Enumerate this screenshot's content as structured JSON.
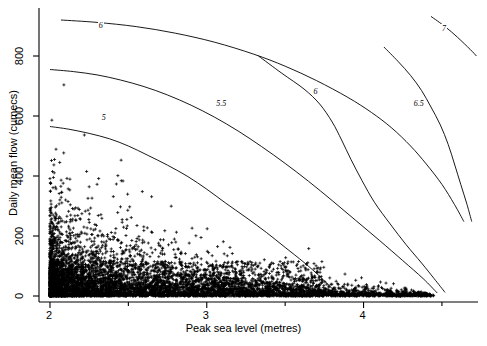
{
  "chart_data": {
    "type": "scatter",
    "title": "",
    "xlabel": "Peak sea level (metres)",
    "ylabel": "Daily mean flow (cumecs)",
    "xlim": [
      1.93,
      4.73
    ],
    "ylim": [
      -20,
      960
    ],
    "xticks": [
      2,
      3,
      4
    ],
    "xtick_labels": [
      "2",
      "3",
      "4"
    ],
    "xminorticks": [
      2.5,
      3.5,
      4.5
    ],
    "yticks": [
      0,
      200,
      400,
      600,
      800
    ],
    "ytick_labels": [
      "0",
      "200",
      "400",
      "600",
      "800"
    ],
    "grid": false,
    "legend": null,
    "marker": "plus",
    "marker_color": "#000000",
    "line_color": "#000000",
    "contours": [
      {
        "label": "5",
        "label_x": 2.35,
        "label_y": 592,
        "points": [
          [
            2.0,
            565
          ],
          [
            2.12,
            556
          ],
          [
            2.25,
            542
          ],
          [
            2.38,
            524
          ],
          [
            2.5,
            500
          ],
          [
            2.62,
            470
          ],
          [
            2.75,
            436
          ],
          [
            2.88,
            398
          ],
          [
            3.0,
            356
          ],
          [
            3.12,
            310
          ],
          [
            3.25,
            262
          ],
          [
            3.38,
            212
          ],
          [
            3.5,
            162
          ],
          [
            3.62,
            112
          ],
          [
            3.72,
            66
          ],
          [
            3.8,
            25
          ],
          [
            3.86,
            0
          ]
        ]
      },
      {
        "label": "5.5",
        "label_x": 3.08,
        "label_y": 640,
        "points": [
          [
            2.0,
            755
          ],
          [
            2.15,
            748
          ],
          [
            2.3,
            737
          ],
          [
            2.45,
            720
          ],
          [
            2.6,
            698
          ],
          [
            2.75,
            670
          ],
          [
            2.9,
            636
          ],
          [
            3.05,
            596
          ],
          [
            3.2,
            550
          ],
          [
            3.35,
            498
          ],
          [
            3.5,
            442
          ],
          [
            3.65,
            382
          ],
          [
            3.8,
            318
          ],
          [
            3.95,
            252
          ],
          [
            4.1,
            186
          ],
          [
            4.25,
            118
          ],
          [
            4.38,
            58
          ],
          [
            4.47,
            10
          ]
        ]
      },
      {
        "label": "6",
        "label_x": 2.33,
        "label_y": 900,
        "points": [
          [
            2.07,
            920
          ],
          [
            2.3,
            912
          ],
          [
            2.55,
            898
          ],
          [
            2.8,
            876
          ],
          [
            3.05,
            846
          ],
          [
            3.3,
            806
          ],
          [
            3.5,
            766
          ],
          [
            3.7,
            718
          ],
          [
            3.9,
            662
          ],
          [
            4.05,
            612
          ],
          [
            4.18,
            560
          ],
          [
            4.3,
            500
          ],
          [
            4.4,
            440
          ],
          [
            4.5,
            372
          ],
          [
            4.58,
            305
          ],
          [
            4.64,
            248
          ]
        ]
      },
      {
        "label": "6",
        "label_x": 3.7,
        "label_y": 680,
        "points": [
          [
            3.33,
            800
          ],
          [
            3.48,
            742
          ],
          [
            3.62,
            690
          ],
          [
            3.72,
            640
          ],
          [
            3.8,
            580
          ],
          [
            3.86,
            520
          ],
          [
            3.92,
            455
          ],
          [
            3.99,
            385
          ],
          [
            4.07,
            312
          ],
          [
            4.17,
            240
          ],
          [
            4.27,
            172
          ],
          [
            4.37,
            110
          ],
          [
            4.45,
            58
          ],
          [
            4.52,
            12
          ]
        ]
      },
      {
        "label": "6.5",
        "label_x": 4.34,
        "label_y": 640,
        "points": [
          [
            4.13,
            830
          ],
          [
            4.22,
            782
          ],
          [
            4.3,
            735
          ],
          [
            4.37,
            685
          ],
          [
            4.43,
            630
          ],
          [
            4.49,
            570
          ],
          [
            4.54,
            505
          ],
          [
            4.58,
            440
          ],
          [
            4.62,
            372
          ],
          [
            4.66,
            305
          ],
          [
            4.69,
            248
          ]
        ]
      },
      {
        "label": "7",
        "label_x": 4.52,
        "label_y": 890,
        "points": [
          [
            4.43,
            932
          ],
          [
            4.52,
            898
          ],
          [
            4.6,
            862
          ],
          [
            4.68,
            822
          ],
          [
            4.72,
            800
          ]
        ]
      }
    ],
    "scatter_summary": {
      "n_points_approx": 4800,
      "x_mode": 2.35,
      "y_mode": 40,
      "description": "Highly dense band from x=2.0 to x=3.3 with y below 250; density decays sharply with increasing flow and sea level; isolated points extend to x~4.4 and y~700."
    }
  },
  "axes": {
    "xlabel": "Peak sea level (metres)",
    "ylabel": "Daily mean flow (cumecs)",
    "xticks": [
      "2",
      "3",
      "4"
    ],
    "yticks": [
      "0",
      "200",
      "400",
      "600",
      "800"
    ]
  }
}
